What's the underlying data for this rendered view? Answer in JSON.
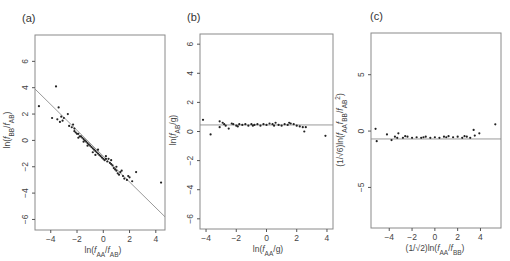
{
  "chart_data": [
    {
      "panel": "(a)",
      "type": "scatter",
      "xlabel": "ln(f_AA/f_AB)",
      "ylabel": "ln(f_BB/f_AB)",
      "xticks": [
        -4,
        -2,
        0,
        2,
        4
      ],
      "yticks": [
        -6,
        -4,
        -2,
        0,
        2,
        4,
        6
      ],
      "xlim": [
        -5.2,
        4.7
      ],
      "ylim": [
        -6.8,
        8.0
      ],
      "reference_line": {
        "type": "line",
        "x": [
          -5.2,
          4.7
        ],
        "y": [
          3.9,
          -5.8
        ]
      },
      "points": [
        [
          -4.9,
          2.6
        ],
        [
          -3.6,
          4.1
        ],
        [
          -3.4,
          2.5
        ],
        [
          -3.9,
          1.7
        ],
        [
          -3.5,
          1.6
        ],
        [
          -3.3,
          1.4
        ],
        [
          -3.2,
          1.8
        ],
        [
          -3.0,
          1.7
        ],
        [
          -2.7,
          2.0
        ],
        [
          -3.1,
          1.5
        ],
        [
          -2.6,
          1.1
        ],
        [
          -2.4,
          1.0
        ],
        [
          -2.3,
          1.2
        ],
        [
          -2.2,
          0.9
        ],
        [
          -2.1,
          0.6
        ],
        [
          -2.0,
          0.5
        ],
        [
          -1.9,
          0.5
        ],
        [
          -1.8,
          0.3
        ],
        [
          -1.7,
          0.3
        ],
        [
          -1.6,
          0.2
        ],
        [
          -1.5,
          0.1
        ],
        [
          -1.4,
          0.0
        ],
        [
          -1.3,
          -0.1
        ],
        [
          -1.2,
          -0.2
        ],
        [
          -1.1,
          -0.3
        ],
        [
          -1.0,
          -0.4
        ],
        [
          -0.9,
          -0.5
        ],
        [
          -0.8,
          -0.6
        ],
        [
          -0.7,
          -0.7
        ],
        [
          -0.6,
          -0.8
        ],
        [
          -0.5,
          -0.9
        ],
        [
          -0.4,
          -1.0
        ],
        [
          -0.3,
          -1.1
        ],
        [
          -0.2,
          -1.2
        ],
        [
          -0.1,
          -1.3
        ],
        [
          0.0,
          -1.4
        ],
        [
          0.1,
          -1.5
        ],
        [
          0.2,
          -1.4
        ],
        [
          0.3,
          -1.6
        ],
        [
          0.5,
          -1.7
        ],
        [
          0.6,
          -1.8
        ],
        [
          0.7,
          -1.9
        ],
        [
          0.8,
          -2.1
        ],
        [
          0.9,
          -2.2
        ],
        [
          1.0,
          -2.3
        ],
        [
          1.1,
          -2.5
        ],
        [
          1.2,
          -2.6
        ],
        [
          1.3,
          -2.4
        ],
        [
          1.5,
          -2.7
        ],
        [
          1.6,
          -2.9
        ],
        [
          1.8,
          -3.0
        ],
        [
          2.0,
          -2.8
        ],
        [
          2.5,
          -2.4
        ],
        [
          2.2,
          -3.1
        ],
        [
          4.4,
          -3.2
        ],
        [
          -2.2,
          0.7
        ],
        [
          -1.9,
          0.2
        ],
        [
          -1.2,
          -0.4
        ],
        [
          -0.8,
          -0.9
        ],
        [
          -0.4,
          -0.7
        ],
        [
          0.2,
          -1.2
        ],
        [
          0.6,
          -1.5
        ],
        [
          1.0,
          -2.0
        ],
        [
          1.4,
          -2.3
        ],
        [
          1.9,
          -2.7
        ],
        [
          -1.5,
          -0.1
        ],
        [
          -0.6,
          -1.1
        ],
        [
          0.4,
          -1.4
        ]
      ]
    },
    {
      "panel": "(b)",
      "type": "scatter",
      "xlabel": "ln(f_AA/g)",
      "ylabel": "ln(f_AB/g)",
      "xticks": [
        -4,
        -2,
        0,
        2,
        4
      ],
      "yticks": [
        -6,
        -4,
        -2,
        0,
        2,
        4,
        6
      ],
      "xlim": [
        -4.4,
        4.4
      ],
      "ylim": [
        -6.7,
        6.7
      ],
      "reference_line": {
        "type": "hline",
        "y": 0.45
      },
      "points": [
        [
          -4.2,
          0.8
        ],
        [
          -3.7,
          -0.2
        ],
        [
          -3.1,
          0.7
        ],
        [
          -3.1,
          0.3
        ],
        [
          -2.9,
          0.6
        ],
        [
          -2.8,
          0.5
        ],
        [
          -2.7,
          0.4
        ],
        [
          -2.5,
          0.2
        ],
        [
          -2.2,
          0.5
        ],
        [
          -2.0,
          0.4
        ],
        [
          -1.8,
          0.5
        ],
        [
          -1.6,
          0.45
        ],
        [
          -1.4,
          0.5
        ],
        [
          -1.2,
          0.4
        ],
        [
          -1.0,
          0.5
        ],
        [
          -0.8,
          0.45
        ],
        [
          -0.6,
          0.5
        ],
        [
          -0.4,
          0.4
        ],
        [
          -0.2,
          0.5
        ],
        [
          0.0,
          0.45
        ],
        [
          0.2,
          0.55
        ],
        [
          0.4,
          0.5
        ],
        [
          0.6,
          0.6
        ],
        [
          0.8,
          0.45
        ],
        [
          1.0,
          0.4
        ],
        [
          1.2,
          0.5
        ],
        [
          1.4,
          0.45
        ],
        [
          1.6,
          0.55
        ],
        [
          1.8,
          0.5
        ],
        [
          2.0,
          0.4
        ],
        [
          2.2,
          0.35
        ],
        [
          2.4,
          0.3
        ],
        [
          2.5,
          0.0
        ],
        [
          2.6,
          0.3
        ],
        [
          3.9,
          -0.3
        ],
        [
          -1.9,
          0.35
        ],
        [
          -0.9,
          0.4
        ],
        [
          0.5,
          0.4
        ],
        [
          1.5,
          0.6
        ],
        [
          -2.3,
          0.55
        ]
      ]
    },
    {
      "panel": "(c)",
      "type": "scatter",
      "xlabel": "(1/√2)ln(f_AA/f_BB)",
      "ylabel": "(1/√6)ln(f_AA f_BB/f_AB²)",
      "xticks": [
        -4,
        -2,
        0,
        2,
        4
      ],
      "yticks": [
        -5,
        0,
        5
      ],
      "xlim": [
        -5.6,
        5.8
      ],
      "ylim": [
        -8.6,
        8.7
      ],
      "reference_line": {
        "type": "hline",
        "y": -0.7
      },
      "points": [
        [
          -5.2,
          0.2
        ],
        [
          -5.1,
          -0.9
        ],
        [
          -4.2,
          -0.3
        ],
        [
          -3.8,
          -0.8
        ],
        [
          -3.5,
          -0.5
        ],
        [
          -3.3,
          -0.6
        ],
        [
          -3.2,
          -0.2
        ],
        [
          -2.8,
          -0.6
        ],
        [
          -2.4,
          -0.5
        ],
        [
          -2.0,
          -0.6
        ],
        [
          -1.6,
          -0.55
        ],
        [
          -1.2,
          -0.6
        ],
        [
          -0.8,
          -0.5
        ],
        [
          -0.4,
          -0.6
        ],
        [
          0.0,
          -0.55
        ],
        [
          0.4,
          -0.6
        ],
        [
          0.8,
          -0.5
        ],
        [
          1.2,
          -0.45
        ],
        [
          1.6,
          -0.55
        ],
        [
          2.0,
          -0.5
        ],
        [
          2.4,
          -0.6
        ],
        [
          2.8,
          -0.5
        ],
        [
          3.1,
          -0.6
        ],
        [
          3.4,
          0.1
        ],
        [
          3.5,
          -0.4
        ],
        [
          3.9,
          -0.2
        ],
        [
          5.3,
          0.6
        ],
        [
          -2.6,
          -0.45
        ],
        [
          -1.0,
          -0.55
        ],
        [
          1.0,
          -0.55
        ],
        [
          2.6,
          -0.45
        ]
      ]
    }
  ],
  "panels": {
    "a": {
      "label": "(a)",
      "xlabel": "ln(f",
      "ylabel": "ln(f"
    },
    "b": {
      "label": "(b)"
    },
    "c": {
      "label": "(c)"
    }
  }
}
